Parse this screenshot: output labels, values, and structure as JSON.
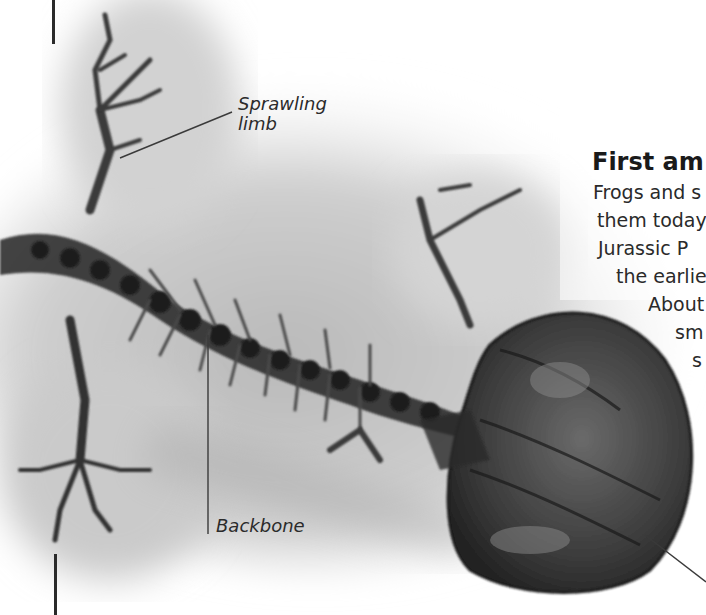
{
  "page": {
    "heading": "First am",
    "body_lines": [
      {
        "text": "Frogs and s",
        "x": 593,
        "y": 182
      },
      {
        "text": "them today",
        "x": 597,
        "y": 210
      },
      {
        "text": "Jurassic P",
        "x": 598,
        "y": 238
      },
      {
        "text": "the earlie",
        "x": 617,
        "y": 266
      },
      {
        "text": "About",
        "x": 648,
        "y": 294
      },
      {
        "text": "sm",
        "x": 675,
        "y": 322
      },
      {
        "text": "s",
        "x": 693,
        "y": 350
      }
    ]
  },
  "figure": {
    "callouts": [
      {
        "label_line1": "Sprawling",
        "label_line2": "limb"
      },
      {
        "label_line1": "Backbone"
      }
    ]
  },
  "colors": {
    "text": "#2a2a2a",
    "heading": "#1a1a1a",
    "rule": "#2a2a2a",
    "fossil_dark": "#2e2e2e",
    "matrix": "#c8c8c8"
  }
}
